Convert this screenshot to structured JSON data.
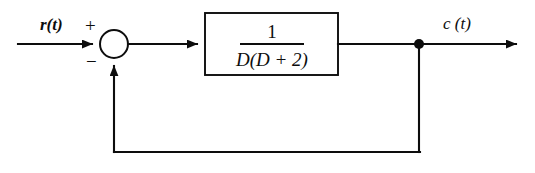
{
  "diagram": {
    "kind": "control-system-block-diagram",
    "background_color": "#ffffff",
    "line_color": "#0d0d0d",
    "input": {
      "label": "r(t)",
      "sign": "+"
    },
    "feedback": {
      "sign": "−",
      "type": "unity"
    },
    "plant": {
      "numerator": "1",
      "denominator": "D(D + 2)",
      "transfer_function": "1/D(D + 2)"
    },
    "output": {
      "label": "c (t)"
    }
  },
  "geometry": {
    "input_line": {
      "x1": 18,
      "y1": 44,
      "x2": 94,
      "y2": 44
    },
    "sum": {
      "cx": 114,
      "cy": 44,
      "r": 14
    },
    "sum_to_block": {
      "x1": 128,
      "y1": 44,
      "x2": 199,
      "y2": 44
    },
    "block": {
      "x": 205,
      "y": 13,
      "w": 133,
      "h": 62
    },
    "block_to_node": {
      "x1": 338,
      "y1": 44,
      "x2": 419,
      "y2": 44
    },
    "node": {
      "cx": 419,
      "cy": 44,
      "r": 5
    },
    "node_to_out": {
      "x1": 419,
      "y1": 44,
      "x2": 518,
      "y2": 44
    },
    "fb_down": {
      "x1": 419,
      "y1": 44,
      "x2": 419,
      "y2": 152
    },
    "fb_across": {
      "x1": 419,
      "y1": 152,
      "x2": 114,
      "y2": 152
    },
    "fb_up": {
      "x1": 114,
      "y1": 152,
      "x2": 114,
      "y2": 64
    },
    "frac_bar": {
      "x1": 240,
      "y1": 44,
      "x2": 304,
      "y2": 44
    }
  }
}
